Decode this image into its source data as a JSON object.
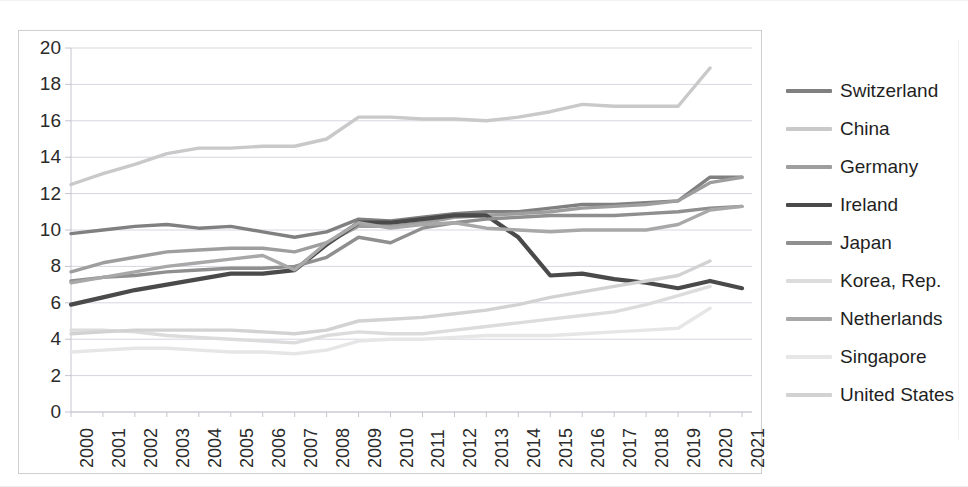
{
  "chart_data": {
    "type": "line",
    "title": "",
    "xlabel": "",
    "ylabel": "",
    "x": [
      2000,
      2001,
      2002,
      2003,
      2004,
      2005,
      2006,
      2007,
      2008,
      2009,
      2010,
      2011,
      2012,
      2013,
      2014,
      2015,
      2016,
      2017,
      2018,
      2019,
      2020,
      2021
    ],
    "xtick_labels": [
      "2000",
      "2001",
      "2002",
      "2003",
      "2004",
      "2005",
      "2006",
      "2007",
      "2008",
      "2009",
      "2010",
      "2011",
      "2012",
      "2013",
      "2014",
      "2015",
      "2016",
      "2017",
      "2018",
      "2019",
      "2020",
      "2021"
    ],
    "ytick_labels": [
      "0",
      "2",
      "4",
      "6",
      "8",
      "10",
      "12",
      "14",
      "16",
      "18",
      "20"
    ],
    "ylim": [
      0,
      20
    ],
    "ystep": 2,
    "xlim": [
      2000,
      2021
    ],
    "grid": true,
    "legend_position": "right",
    "series": [
      {
        "name": "Switzerland",
        "color": "#808080",
        "width": 3.4,
        "values": [
          9.8,
          10.0,
          10.2,
          10.3,
          10.1,
          10.2,
          9.9,
          9.6,
          9.9,
          10.6,
          10.5,
          10.7,
          10.9,
          11.0,
          11.0,
          11.2,
          11.4,
          11.4,
          11.5,
          11.6,
          12.9,
          12.9
        ]
      },
      {
        "name": "China",
        "color": "#c9c9c9",
        "width": 3.4,
        "values": [
          12.5,
          13.1,
          13.6,
          14.2,
          14.5,
          14.5,
          14.6,
          14.6,
          15.0,
          16.2,
          16.2,
          16.1,
          16.1,
          16.0,
          16.2,
          16.5,
          16.9,
          16.8,
          16.8,
          16.8,
          18.9,
          null
        ]
      },
      {
        "name": "Germany",
        "color": "#9e9e9e",
        "width": 3.4,
        "values": [
          7.7,
          8.2,
          8.5,
          8.8,
          8.9,
          9.0,
          9.0,
          8.8,
          9.3,
          10.2,
          10.2,
          10.4,
          10.7,
          10.8,
          10.9,
          11.0,
          11.2,
          11.3,
          11.4,
          11.6,
          12.6,
          12.9
        ]
      },
      {
        "name": "Ireland",
        "color": "#4a4a4a",
        "width": 4.2,
        "values": [
          5.9,
          6.3,
          6.7,
          7.0,
          7.3,
          7.6,
          7.6,
          7.8,
          9.2,
          10.4,
          10.4,
          10.6,
          10.8,
          10.8,
          9.6,
          7.5,
          7.6,
          7.3,
          7.1,
          6.8,
          7.2,
          6.8
        ]
      },
      {
        "name": "Japan",
        "color": "#8f8f8f",
        "width": 3.4,
        "values": [
          7.2,
          7.4,
          7.5,
          7.7,
          7.8,
          7.9,
          7.9,
          8.0,
          8.5,
          9.6,
          9.3,
          10.1,
          10.4,
          10.6,
          10.7,
          10.8,
          10.8,
          10.8,
          10.9,
          11.0,
          11.2,
          11.3
        ]
      },
      {
        "name": "Korea, Rep.",
        "color": "#dcdcdc",
        "width": 3.4,
        "values": [
          4.5,
          4.5,
          4.4,
          4.2,
          4.1,
          4.0,
          3.9,
          3.8,
          4.2,
          4.4,
          4.3,
          4.3,
          4.5,
          4.7,
          4.9,
          5.1,
          5.3,
          5.5,
          5.9,
          6.4,
          6.9,
          null
        ]
      },
      {
        "name": "Netherlands",
        "color": "#a8a8a8",
        "width": 3.4,
        "values": [
          7.1,
          7.4,
          7.7,
          8.0,
          8.2,
          8.4,
          8.6,
          7.8,
          9.3,
          10.4,
          10.1,
          10.3,
          10.4,
          10.1,
          10.0,
          9.9,
          10.0,
          10.0,
          10.0,
          10.3,
          11.1,
          11.3
        ]
      },
      {
        "name": "Singapore",
        "color": "#e6e6e6",
        "width": 3.4,
        "values": [
          3.3,
          3.4,
          3.5,
          3.5,
          3.4,
          3.3,
          3.3,
          3.2,
          3.4,
          3.9,
          4.0,
          4.0,
          4.1,
          4.2,
          4.2,
          4.2,
          4.3,
          4.4,
          4.5,
          4.6,
          5.7,
          null
        ]
      },
      {
        "name": "United States",
        "color": "#d2d2d2",
        "width": 3.4,
        "values": [
          4.3,
          4.4,
          4.5,
          4.5,
          4.5,
          4.5,
          4.4,
          4.3,
          4.5,
          5.0,
          5.1,
          5.2,
          5.4,
          5.6,
          5.9,
          6.3,
          6.6,
          6.9,
          7.2,
          7.5,
          8.3,
          null
        ]
      }
    ]
  },
  "legend": {
    "items": [
      {
        "label": "Switzerland"
      },
      {
        "label": "China"
      },
      {
        "label": "Germany"
      },
      {
        "label": "Ireland"
      },
      {
        "label": "Japan"
      },
      {
        "label": "Korea, Rep."
      },
      {
        "label": "Netherlands"
      },
      {
        "label": "Singapore"
      },
      {
        "label": "United States"
      }
    ]
  }
}
